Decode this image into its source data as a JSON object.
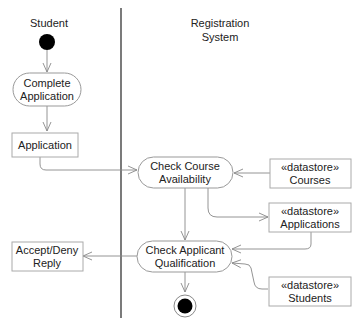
{
  "diagram": {
    "type": "UML activity diagram",
    "swimlanes": [
      {
        "id": "student",
        "label": "Student"
      },
      {
        "id": "registration",
        "label_line1": "Registration",
        "label_line2": "System"
      }
    ],
    "nodes": {
      "initial": {
        "kind": "initial-node"
      },
      "complete_application": {
        "kind": "action",
        "line1": "Complete",
        "line2": "Application"
      },
      "application": {
        "kind": "object",
        "label": "Application"
      },
      "check_course": {
        "kind": "action",
        "line1": "Check Course",
        "line2": "Availability"
      },
      "courses": {
        "kind": "datastore",
        "stereotype": "«datastore»",
        "label": "Courses"
      },
      "applications": {
        "kind": "datastore",
        "stereotype": "«datastore»",
        "label": "Applications"
      },
      "check_applicant": {
        "kind": "action",
        "line1": "Check Applicant",
        "line2": "Qualification"
      },
      "students": {
        "kind": "datastore",
        "stereotype": "«datastore»",
        "label": "Students"
      },
      "reply": {
        "kind": "object",
        "line1": "Accept/Deny",
        "line2": "Reply"
      },
      "final": {
        "kind": "activity-final-node"
      }
    },
    "edges": [
      [
        "initial",
        "complete_application"
      ],
      [
        "complete_application",
        "application"
      ],
      [
        "application",
        "check_course"
      ],
      [
        "courses",
        "check_course"
      ],
      [
        "check_course",
        "applications"
      ],
      [
        "check_course",
        "check_applicant"
      ],
      [
        "applications",
        "check_applicant"
      ],
      [
        "students",
        "check_applicant"
      ],
      [
        "check_applicant",
        "reply"
      ],
      [
        "check_applicant",
        "final"
      ]
    ],
    "colors": {
      "line": "#888888",
      "stroke": "#999999",
      "text": "#222222",
      "fill": "#ffffff",
      "node": "#000000"
    }
  }
}
